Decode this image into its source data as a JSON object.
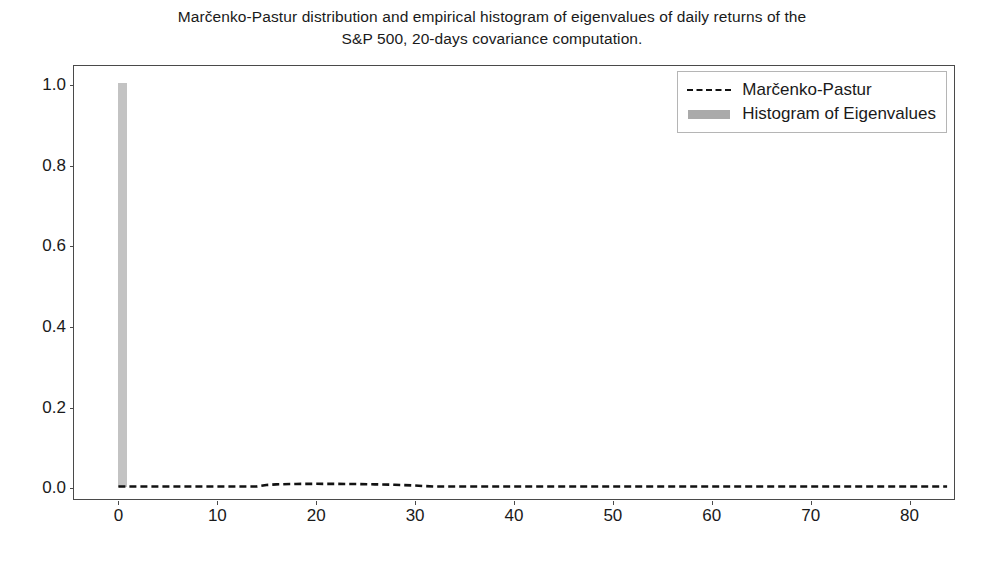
{
  "chart_data": {
    "type": "bar",
    "title": "Marčenko-Pastur distribution and empirical histogram of eigenvalues of daily returns of the S&P 500, 20-days covariance computation.",
    "title_line1": "Marčenko-Pastur distribution and empirical histogram of eigenvalues of daily returns of the",
    "title_line2": "S&P 500, 20-days covariance computation.",
    "xlabel": "",
    "ylabel": "",
    "xlim": [
      -4.5,
      84.7
    ],
    "ylim": [
      -0.031,
      1.047
    ],
    "grid": false,
    "legend_position": "upper right",
    "xticks": [
      0,
      10,
      20,
      30,
      40,
      50,
      60,
      70,
      80
    ],
    "xtick_labels": [
      "0",
      "10",
      "20",
      "30",
      "40",
      "50",
      "60",
      "70",
      "80"
    ],
    "yticks": [
      0.0,
      0.2,
      0.4,
      0.6,
      0.8,
      1.0
    ],
    "ytick_labels": [
      "0.0",
      "0.2",
      "0.4",
      "0.6",
      "0.8",
      "1.0"
    ],
    "series": [
      {
        "name": "Histogram of Eigenvalues",
        "type": "bar",
        "color": "#c3c3c3",
        "bar_width": 0.9,
        "categories": [
          0.45
        ],
        "values": [
          1.0
        ]
      },
      {
        "name": "Marčenko-Pastur",
        "type": "line",
        "color": "#121212",
        "linestyle": "dashed",
        "x": [
          0,
          2,
          4,
          6,
          8,
          10,
          12,
          14,
          15,
          16,
          18,
          20,
          22,
          24,
          26,
          28,
          30,
          31,
          32,
          34,
          40,
          50,
          60,
          70,
          80,
          84
        ],
        "values": [
          0.0,
          0.0,
          0.0,
          0.0,
          0.0,
          0.0,
          0.0,
          0.0,
          0.004,
          0.0055,
          0.0065,
          0.0068,
          0.0066,
          0.0062,
          0.0055,
          0.0044,
          0.0026,
          0.0012,
          0.0,
          0.0,
          0.0,
          0.0,
          0.0,
          0.0,
          0.0,
          0.0
        ]
      }
    ]
  },
  "legend": {
    "entries": [
      {
        "label": "Marčenko-Pastur",
        "key": "dashed-line-key",
        "color": "#121212"
      },
      {
        "label": "Histogram of Eigenvalues",
        "key": "gray-patch-key",
        "color": "#aaaaaa"
      }
    ]
  }
}
